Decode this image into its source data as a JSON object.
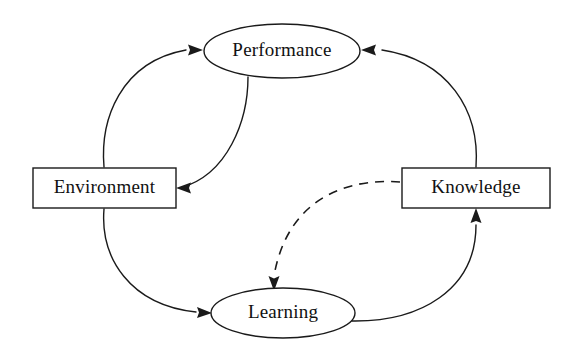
{
  "diagram": {
    "background_color": "#ffffff",
    "line_color": "#1a1a1a",
    "text_color": "#111111",
    "nodes": [
      {
        "id": "performance",
        "label": "Performance",
        "shape": "ellipse",
        "cx": 282,
        "cy": 51,
        "rx": 78,
        "ry": 27
      },
      {
        "id": "environment",
        "label": "Environment",
        "shape": "rectangle",
        "x": 33,
        "y": 168,
        "width": 143,
        "height": 40
      },
      {
        "id": "knowledge",
        "label": "Knowledge",
        "shape": "rectangle",
        "x": 402,
        "y": 168,
        "width": 148,
        "height": 40
      },
      {
        "id": "learning",
        "label": "Learning",
        "shape": "ellipse",
        "cx": 283,
        "cy": 313,
        "rx": 72,
        "ry": 25
      }
    ],
    "edges": [
      {
        "id": "environment-to-performance",
        "from": "environment",
        "to": "performance",
        "style": "solid",
        "arrow": "single",
        "arrow_at": "performance-left"
      },
      {
        "id": "performance-to-environment",
        "from": "performance",
        "to": "environment",
        "style": "solid",
        "arrow": "single",
        "arrow_at": "environment-right"
      },
      {
        "id": "environment-to-learning",
        "from": "environment",
        "to": "learning",
        "style": "solid",
        "arrow": "single",
        "arrow_at": "learning-left"
      },
      {
        "id": "learning-to-knowledge",
        "from": "learning",
        "to": "knowledge",
        "style": "solid",
        "arrow": "single",
        "arrow_at": "knowledge-bottom"
      },
      {
        "id": "knowledge-to-performance",
        "from": "knowledge",
        "to": "performance",
        "style": "solid",
        "arrow": "single",
        "arrow_at": "performance-right"
      },
      {
        "id": "knowledge-to-learning",
        "from": "knowledge",
        "to": "learning",
        "style": "dashed",
        "arrow": "single",
        "arrow_at": "learning-top"
      }
    ]
  }
}
